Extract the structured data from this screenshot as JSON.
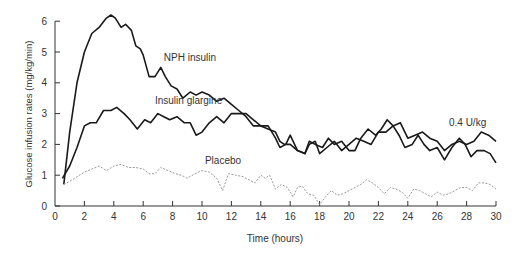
{
  "chart_data": {
    "type": "line",
    "title": "",
    "xlabel": "Time (hours)",
    "ylabel": "Glucose infusion rates (mg/kg/min)",
    "xlim": [
      0,
      30
    ],
    "ylim": [
      0,
      6
    ],
    "xticks": [
      0,
      2,
      4,
      6,
      8,
      10,
      12,
      14,
      16,
      18,
      20,
      22,
      24,
      26,
      28,
      30
    ],
    "yticks": [
      0,
      1,
      2,
      3,
      4,
      5,
      6
    ],
    "grid": false,
    "annotations": [
      {
        "text": "NPH insulin",
        "x": 7.4,
        "y": 4.7
      },
      {
        "text": "Insulin glargine",
        "x": 6.8,
        "y": 3.3
      },
      {
        "text": "Placebo",
        "x": 10.2,
        "y": 1.35
      },
      {
        "text": "0.4 U/kg",
        "x": 26.8,
        "y": 2.6
      }
    ],
    "series": [
      {
        "name": "NPH insulin",
        "style": "solid",
        "color": "#1a1a1a",
        "x": [
          0.6,
          1.0,
          1.5,
          2.0,
          2.5,
          3.0,
          3.5,
          3.8,
          4.1,
          4.5,
          4.8,
          5.2,
          5.5,
          5.8,
          6.0,
          6.4,
          6.8,
          7.2,
          7.5,
          7.9,
          8.3,
          8.7,
          9.2,
          9.6,
          10.0,
          10.5,
          11.0,
          11.5,
          12.0,
          12.5,
          13.0,
          13.5,
          14.0,
          14.5,
          15.0,
          15.3,
          15.7,
          16.0,
          16.5,
          17.0,
          17.3,
          17.7,
          18.0,
          18.5,
          19.0,
          19.5,
          20.0,
          20.5,
          21.0,
          21.5,
          22.0,
          22.5,
          23.0,
          23.5,
          24.0,
          24.5,
          25.0,
          25.5,
          26.0,
          26.5,
          27.0,
          27.5,
          28.0,
          28.5,
          29.0,
          29.5,
          30.0
        ],
        "y": [
          0.7,
          2.4,
          4.0,
          5.0,
          5.6,
          5.8,
          6.1,
          6.2,
          6.1,
          5.8,
          5.9,
          5.7,
          5.2,
          5.1,
          4.9,
          4.2,
          4.2,
          4.5,
          4.2,
          3.9,
          3.8,
          3.5,
          3.7,
          3.6,
          3.7,
          3.6,
          3.4,
          3.5,
          3.3,
          3.1,
          2.9,
          2.6,
          2.6,
          2.6,
          2.2,
          1.9,
          2.0,
          2.3,
          1.8,
          1.7,
          2.0,
          2.1,
          1.7,
          1.9,
          2.1,
          1.8,
          2.0,
          2.2,
          2.1,
          2.0,
          2.4,
          2.4,
          2.6,
          2.7,
          2.2,
          2.3,
          2.4,
          2.2,
          2.1,
          1.8,
          2.0,
          2.1,
          2.0,
          2.1,
          2.4,
          2.3,
          2.1
        ]
      },
      {
        "name": "Insulin glargine",
        "style": "solid",
        "color": "#1a1a1a",
        "x": [
          0.5,
          1.0,
          1.5,
          2.0,
          2.4,
          2.8,
          3.3,
          3.8,
          4.2,
          4.7,
          5.1,
          5.6,
          6.1,
          6.5,
          7.0,
          7.4,
          7.8,
          8.3,
          8.8,
          9.2,
          9.6,
          10.0,
          10.5,
          11.0,
          11.5,
          12.0,
          12.5,
          13.0,
          13.5,
          14.0,
          14.5,
          15.0,
          15.3,
          15.6,
          16.0,
          16.5,
          17.0,
          17.3,
          17.7,
          18.2,
          18.6,
          19.0,
          19.5,
          20.0,
          20.4,
          20.8,
          21.3,
          21.8,
          22.2,
          22.6,
          23.0,
          23.4,
          23.8,
          24.3,
          24.7,
          25.1,
          25.5,
          26.0,
          26.5,
          27.0,
          27.5,
          27.9,
          28.3,
          28.7,
          29.2,
          29.6,
          30.0
        ],
        "y": [
          0.9,
          1.3,
          1.9,
          2.6,
          2.7,
          2.7,
          3.1,
          3.1,
          3.2,
          3.0,
          2.8,
          2.5,
          2.8,
          2.7,
          3.0,
          2.9,
          2.8,
          2.9,
          2.7,
          2.7,
          2.3,
          2.4,
          2.7,
          2.9,
          2.7,
          3.0,
          3.0,
          3.0,
          2.8,
          2.6,
          2.5,
          2.4,
          2.1,
          2.0,
          2.0,
          1.8,
          1.7,
          2.1,
          2.0,
          1.9,
          2.2,
          2.0,
          2.1,
          1.8,
          1.8,
          2.2,
          2.5,
          2.3,
          2.5,
          2.8,
          2.6,
          2.3,
          1.9,
          2.0,
          2.3,
          2.0,
          1.8,
          1.9,
          1.5,
          1.9,
          2.2,
          2.0,
          1.6,
          1.8,
          1.8,
          1.7,
          1.4
        ]
      },
      {
        "name": "Placebo",
        "style": "dashed",
        "color": "#999999",
        "x": [
          0.6,
          1.0,
          1.5,
          2.0,
          2.5,
          3.0,
          3.5,
          4.0,
          4.5,
          5.0,
          5.5,
          6.0,
          6.4,
          6.8,
          7.2,
          7.7,
          8.2,
          8.6,
          9.0,
          9.5,
          10.0,
          10.5,
          11.0,
          11.4,
          11.8,
          12.3,
          12.8,
          13.2,
          13.6,
          14.0,
          14.3,
          14.6,
          15.0,
          15.4,
          15.8,
          16.2,
          16.5,
          16.8,
          17.2,
          17.6,
          18.0,
          18.4,
          18.8,
          19.2,
          19.6,
          20.0,
          20.4,
          20.8,
          21.2,
          21.6,
          22.0,
          22.4,
          22.8,
          23.2,
          23.6,
          24.0,
          24.4,
          24.8,
          25.2,
          25.6,
          26.0,
          26.4,
          26.8,
          27.2,
          27.6,
          28.0,
          28.4,
          28.8,
          29.2,
          29.6,
          30.0
        ],
        "y": [
          0.7,
          0.8,
          0.95,
          1.1,
          1.2,
          1.3,
          1.15,
          1.3,
          1.35,
          1.25,
          1.25,
          1.2,
          1.05,
          1.05,
          1.25,
          1.15,
          1.05,
          1.0,
          0.9,
          1.05,
          1.15,
          1.1,
          0.9,
          0.5,
          1.05,
          1.0,
          0.95,
          0.85,
          0.75,
          1.0,
          0.9,
          1.0,
          0.55,
          0.7,
          0.6,
          0.3,
          0.6,
          0.65,
          0.4,
          0.35,
          0.05,
          0.3,
          0.5,
          0.35,
          0.4,
          0.5,
          0.6,
          0.7,
          0.85,
          0.75,
          0.6,
          0.4,
          0.6,
          0.55,
          0.45,
          0.25,
          0.55,
          0.5,
          0.4,
          0.3,
          0.45,
          0.35,
          0.4,
          0.5,
          0.6,
          0.6,
          0.5,
          0.75,
          0.75,
          0.7,
          0.55
        ]
      }
    ]
  }
}
